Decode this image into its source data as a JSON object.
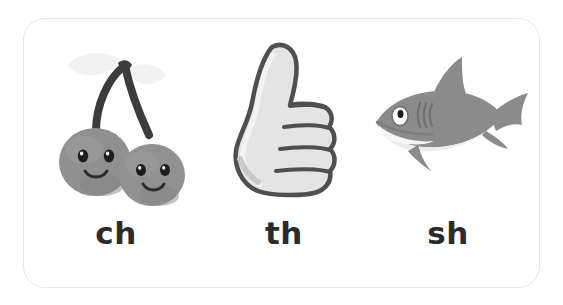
{
  "card": {
    "background_color": "#ffffff",
    "border_color": "#e6e6e6",
    "corner_radius_px": 22
  },
  "theme": {
    "label_color": "#2b2b2b",
    "body_gray": "#8f8f8f",
    "dark_gray": "#5c5c5c",
    "outline_gray": "#4a4a4a",
    "light_gray": "#dcdcdc",
    "pale_gray": "#f0f0f0",
    "stem_dark": "#3c3c3c",
    "eye_black": "#1c1c1c",
    "white": "#ffffff"
  },
  "items": [
    {
      "id": "ch",
      "label": "ch",
      "icon_name": "cherries-illustration",
      "description": "two smiling gray cherries with dark stems and pale leaves"
    },
    {
      "id": "th",
      "label": "th",
      "icon_name": "thumbs-up-illustration",
      "description": "gray outlined thumbs-up hand with four stacked fingers"
    },
    {
      "id": "sh",
      "label": "sh",
      "icon_name": "shark-illustration",
      "description": "gray shark facing left with white belly, dorsal fin and crescent tail"
    }
  ]
}
